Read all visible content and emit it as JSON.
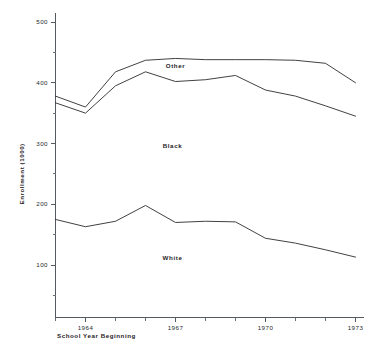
{
  "chart_data": {
    "type": "line",
    "title": "",
    "xlabel": "School Year Beginning",
    "ylabel": "Enrollment (1000)",
    "x": [
      1963,
      1964,
      1965,
      1966,
      1967,
      1968,
      1969,
      1970,
      1971,
      1972,
      1973
    ],
    "xlim": [
      1963,
      1973
    ],
    "ylim": [
      0,
      500
    ],
    "grid": false,
    "legend_position": "inline-annotations",
    "x_tick_labels": [
      "1964",
      "1967",
      "1970",
      "1973"
    ],
    "x_tick_values": [
      1964,
      1967,
      1970,
      1973
    ],
    "x_minor_tick_values": [
      1963,
      1965,
      1966,
      1968,
      1969,
      1971,
      1972
    ],
    "y_tick_labels": [
      "100",
      "200",
      "300",
      "400",
      "500"
    ],
    "y_tick_values": [
      100,
      200,
      300,
      400,
      500
    ],
    "y_minor_tick_values": [
      50,
      150,
      250,
      350,
      450
    ],
    "series": [
      {
        "name": "Other",
        "label": "Other",
        "label_x": 1967.0,
        "label_y": 424,
        "values": [
          378,
          360,
          418,
          437,
          440,
          438,
          438,
          438,
          437,
          432,
          400
        ]
      },
      {
        "name": "Black",
        "label": "Black",
        "label_x": 1966.9,
        "label_y": 293,
        "values": [
          367,
          350,
          395,
          418,
          402,
          405,
          412,
          388,
          378,
          362,
          345
        ]
      },
      {
        "name": "White",
        "label": "White",
        "label_x": 1966.9,
        "label_y": 108,
        "values": [
          175,
          163,
          172,
          198,
          170,
          172,
          171,
          144,
          136,
          125,
          113
        ]
      }
    ]
  },
  "colors": {
    "line": "#2b2b2b",
    "axis": "#555a60",
    "text": "#1f2225",
    "background": "#ffffff"
  }
}
